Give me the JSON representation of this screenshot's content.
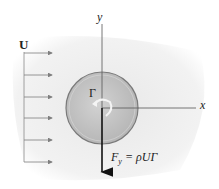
{
  "diagram": {
    "uniform_flow_label": "U",
    "circulation_label": "Γ",
    "x_axis_label": "x",
    "y_axis_label": "y",
    "force_label_main": "F",
    "force_label_sub": "y",
    "force_label_rhs": " = ρUΓ",
    "colors": {
      "cylinder_fill": "#c4c4c4",
      "cylinder_edge": "#7a7a7a",
      "arrow_color": "#7f7f7f",
      "axis_color": "#555555",
      "force_arrow": "#111111",
      "background_blob": "#efefef"
    },
    "flow_arrow_count": 6
  }
}
